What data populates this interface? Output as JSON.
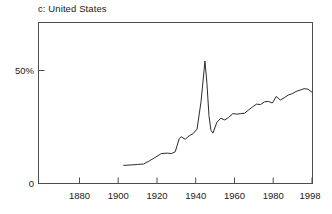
{
  "figure": {
    "panel_label": "c: United States",
    "line_color": "#2b2b2b",
    "frame_color": "#4d4d4d",
    "background": "#ffffff"
  },
  "chart_data": {
    "type": "line",
    "title": "c: United States",
    "xlabel": "",
    "ylabel": "",
    "grid": false,
    "legend": null,
    "xlim": [
      1860,
      1998
    ],
    "ylim": [
      0,
      71
    ],
    "xticks": [
      1880,
      1900,
      1920,
      1940,
      1960,
      1980,
      1998
    ],
    "xtick_labels": [
      "1880",
      "1900",
      "1920",
      "1940",
      "1960",
      "1980",
      "1998"
    ],
    "yticks": [
      0,
      50
    ],
    "ytick_labels": [
      "0",
      "50%"
    ],
    "series": [
      {
        "name": "United States",
        "x": [
          1903,
          1907,
          1910,
          1913,
          1916,
          1919,
          1922,
          1925,
          1927,
          1929,
          1931,
          1932,
          1934,
          1936,
          1938,
          1940,
          1942,
          1944,
          1945,
          1946,
          1947,
          1948,
          1950,
          1952,
          1954,
          1956,
          1958,
          1960,
          1962,
          1964,
          1966,
          1968,
          1970,
          1972,
          1974,
          1976,
          1978,
          1980,
          1982,
          1984,
          1986,
          1988,
          1990,
          1992,
          1994,
          1996,
          1998
        ],
        "values": [
          8.0,
          8.2,
          8.4,
          8.6,
          10.0,
          11.6,
          13.2,
          13.4,
          13.2,
          14.0,
          19.8,
          20.6,
          19.5,
          21.0,
          22.0,
          24.0,
          36.0,
          54.0,
          44.0,
          30.0,
          23.5,
          22.2,
          27.0,
          28.8,
          28.0,
          29.2,
          30.8,
          30.6,
          30.8,
          31.0,
          32.4,
          33.8,
          35.0,
          34.8,
          36.0,
          36.2,
          35.5,
          38.4,
          36.8,
          37.8,
          39.0,
          39.6,
          40.6,
          41.2,
          41.8,
          41.6,
          40.2
        ]
      }
    ]
  }
}
